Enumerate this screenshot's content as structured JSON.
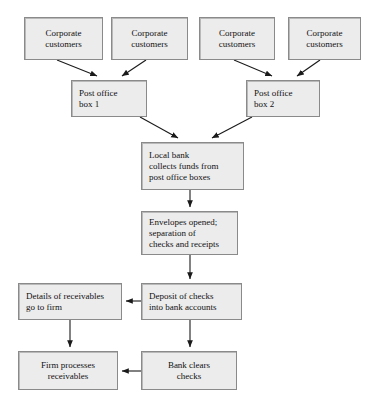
{
  "diagram": {
    "type": "flowchart",
    "style": {
      "node_fill": "#ececec",
      "node_border": "#8a8a8a",
      "edge_color": "#1a1a1a",
      "background": "#ffffff"
    },
    "nodes": [
      {
        "id": "corp1",
        "label": "Corporate\ncustomers",
        "x": 24,
        "y": 17,
        "w": 79,
        "h": 43,
        "align": "center"
      },
      {
        "id": "corp2",
        "label": "Corporate\ncustomers",
        "x": 111,
        "y": 17,
        "w": 77,
        "h": 43,
        "align": "center"
      },
      {
        "id": "corp3",
        "label": "Corporate\ncustomers",
        "x": 199,
        "y": 17,
        "w": 76,
        "h": 43,
        "align": "center"
      },
      {
        "id": "corp4",
        "label": "Corporate\ncustomers",
        "x": 288,
        "y": 17,
        "w": 73,
        "h": 43,
        "align": "center"
      },
      {
        "id": "pobox1",
        "label": "Post office\nbox 1",
        "x": 71,
        "y": 80,
        "w": 76,
        "h": 37,
        "align": "left"
      },
      {
        "id": "pobox2",
        "label": "Post office\nbox 2",
        "x": 246,
        "y": 80,
        "w": 74,
        "h": 37,
        "align": "left"
      },
      {
        "id": "localbank",
        "label": "Local bank\ncollects funds from\npost office boxes",
        "x": 141,
        "y": 142,
        "w": 103,
        "h": 48,
        "align": "left"
      },
      {
        "id": "envelopes",
        "label": "Envelopes opened;\nseparation of\nchecks and receipts",
        "x": 141,
        "y": 211,
        "w": 97,
        "h": 44,
        "align": "left"
      },
      {
        "id": "details",
        "label": "Details of receivables\ngo to firm",
        "x": 18,
        "y": 283,
        "w": 104,
        "h": 37,
        "align": "left"
      },
      {
        "id": "deposit",
        "label": "Deposit of checks\ninto bank accounts",
        "x": 141,
        "y": 283,
        "w": 101,
        "h": 37,
        "align": "left"
      },
      {
        "id": "firm",
        "label": "Firm processes\nreceivables",
        "x": 18,
        "y": 351,
        "w": 100,
        "h": 39,
        "align": "center"
      },
      {
        "id": "bank",
        "label": "Bank clears\nchecks",
        "x": 141,
        "y": 351,
        "w": 96,
        "h": 39,
        "align": "center"
      }
    ],
    "edges": [
      {
        "from": "corp1",
        "to": "pobox1",
        "points": "57,60 97,76"
      },
      {
        "from": "corp2",
        "to": "pobox1",
        "points": "146,60 122,76"
      },
      {
        "from": "corp3",
        "to": "pobox2",
        "points": "234,60 272,76"
      },
      {
        "from": "corp4",
        "to": "pobox2",
        "points": "320,60 297,76"
      },
      {
        "from": "pobox1",
        "to": "localbank",
        "points": "140,117 178,138"
      },
      {
        "from": "pobox2",
        "to": "localbank",
        "points": "252,117 212,138"
      },
      {
        "from": "localbank",
        "to": "envelopes",
        "points": "190,190 190,207"
      },
      {
        "from": "envelopes",
        "to": "deposit",
        "points": "190,255 190,279"
      },
      {
        "from": "deposit",
        "to": "details",
        "points": "141,301 126,301"
      },
      {
        "from": "details",
        "to": "firm",
        "points": "70,320 70,347"
      },
      {
        "from": "deposit",
        "to": "bank",
        "points": "190,320 190,347"
      },
      {
        "from": "bank",
        "to": "firm",
        "points": "141,371 122,371"
      }
    ]
  }
}
